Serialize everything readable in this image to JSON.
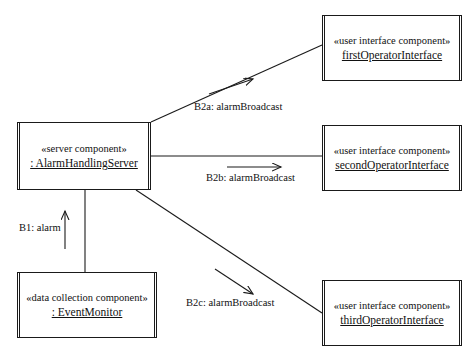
{
  "diagram": {
    "components": [
      {
        "id": "server",
        "stereotype": "«server component»",
        "name": ": AlarmHandlingServer"
      },
      {
        "id": "first-operator",
        "stereotype": "«user interface component»",
        "name": "firstOperatorInterface"
      },
      {
        "id": "second-operator",
        "stereotype": "«user interface component»",
        "name": "secondOperatorInterface"
      },
      {
        "id": "third-operator",
        "stereotype": "«user interface component»",
        "name": "thirdOperatorInterface"
      },
      {
        "id": "event-monitor",
        "stereotype": "«data collection component»",
        "name": ": EventMonitor"
      }
    ],
    "messages": [
      {
        "id": "b1",
        "label": "B1: alarm"
      },
      {
        "id": "b2a",
        "label": "B2a: alarmBroadcast"
      },
      {
        "id": "b2b",
        "label": "B2b: alarmBroadcast"
      },
      {
        "id": "b2c",
        "label": "B2c: alarmBroadcast"
      }
    ],
    "caption": "",
    "colors": {
      "line": "#1a1a1a",
      "background": "#ffffff",
      "text": "#111111"
    }
  }
}
